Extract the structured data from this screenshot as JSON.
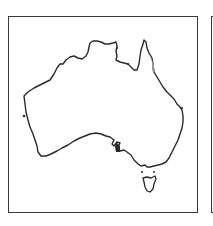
{
  "figure": {
    "type": "map",
    "panels": [
      {
        "id": "left",
        "content": "Australia mainland and Tasmania coastline"
      },
      {
        "id": "right",
        "content": "second panel, clipped at image edge"
      }
    ],
    "colors": {
      "outline": "#2a2a2a",
      "frame": "#3a3a3a",
      "background": "#ffffff",
      "highlight": "#9a9a9a"
    }
  }
}
